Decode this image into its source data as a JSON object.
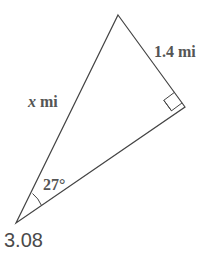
{
  "diagram": {
    "type": "right-triangle",
    "colors": {
      "stroke": "#444444",
      "label": "#555555",
      "answer": "#4a4a4a"
    },
    "vertices": {
      "top": [
        118,
        15
      ],
      "right_angle": [
        185,
        107
      ],
      "bottom_left": [
        16,
        223
      ]
    },
    "labels": {
      "side_opposite": "1.4 mi",
      "hypotenuse_var": "x",
      "hypotenuse_unit": " mi",
      "angle": "27°"
    },
    "right_angle_marker": true
  },
  "answer": "3.08"
}
